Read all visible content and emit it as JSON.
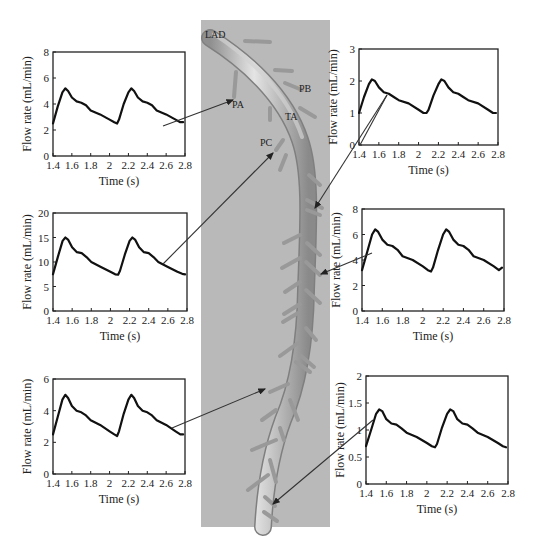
{
  "figure": {
    "vessel_image": {
      "background": "#b9b9b9",
      "labels": [
        {
          "id": "LAD",
          "text": "LAD",
          "x": 205,
          "y": 38
        },
        {
          "id": "PA",
          "text": "PA",
          "x": 232,
          "y": 108
        },
        {
          "id": "PB",
          "text": "PB",
          "x": 299,
          "y": 92
        },
        {
          "id": "TA",
          "text": "TA",
          "x": 285,
          "y": 120
        },
        {
          "id": "PC",
          "text": "PC",
          "x": 260,
          "y": 146
        }
      ]
    },
    "arrows": [
      {
        "from_chart": 0,
        "x1": 163,
        "y1": 126,
        "x2": 233,
        "y2": 100
      },
      {
        "from_chart": 1,
        "x1": 360,
        "y1": 145,
        "x2": 387,
        "y2": 95,
        "x3": 315,
        "y3": 208,
        "note": "line from right-top chart down to branch"
      },
      {
        "from_chart": 2,
        "x1": 163,
        "y1": 264,
        "x2": 273,
        "y2": 153
      },
      {
        "from_chart": 3,
        "x1": 372,
        "y1": 253,
        "x2": 321,
        "y2": 274
      },
      {
        "from_chart": 4,
        "x1": 172,
        "y1": 428,
        "x2": 265,
        "y2": 389
      },
      {
        "from_chart": 5,
        "x1": 373,
        "y1": 420,
        "x2": 273,
        "y2": 504
      }
    ]
  },
  "chart_data": [
    {
      "type": "line",
      "position": "top-left",
      "title": "",
      "xlabel": "Time (s)",
      "ylabel": "Flow rate (mL/min)",
      "xlim": [
        1.4,
        2.8
      ],
      "ylim": [
        0,
        8
      ],
      "xticks": [
        "1.4",
        "1.6",
        "1.8",
        "2",
        "2.2",
        "2.4",
        "2.6",
        "2.8"
      ],
      "yticks": [
        "0",
        "2",
        "4",
        "6",
        "8"
      ],
      "box": {
        "x": 53,
        "y": 52,
        "w": 132,
        "h": 104
      },
      "series": [
        {
          "name": "flow",
          "x": [
            1.4,
            1.45,
            1.5,
            1.53,
            1.56,
            1.6,
            1.65,
            1.7,
            1.75,
            1.8,
            1.9,
            2.0,
            2.05,
            2.08,
            2.1,
            2.15,
            2.2,
            2.23,
            2.26,
            2.3,
            2.35,
            2.4,
            2.45,
            2.5,
            2.6,
            2.7,
            2.75,
            2.78
          ],
          "values": [
            2.5,
            3.8,
            4.9,
            5.2,
            5.0,
            4.5,
            4.2,
            4.1,
            3.9,
            3.5,
            3.2,
            2.8,
            2.6,
            2.5,
            2.8,
            4.0,
            4.9,
            5.2,
            5.0,
            4.5,
            4.2,
            4.1,
            3.9,
            3.5,
            3.2,
            2.8,
            2.6,
            2.6
          ]
        }
      ]
    },
    {
      "type": "line",
      "position": "top-right",
      "title": "",
      "xlabel": "Time (s)",
      "ylabel": "Flow rate (mL/min)",
      "xlim": [
        1.4,
        2.8
      ],
      "ylim": [
        0,
        3
      ],
      "xticks": [
        "1.4",
        "1.6",
        "1.8",
        "2",
        "2.2",
        "2.4",
        "2.6",
        "2.8"
      ],
      "yticks": [
        "0",
        "1",
        "2",
        "3"
      ],
      "box": {
        "x": 359,
        "y": 49,
        "w": 139,
        "h": 96
      },
      "series": [
        {
          "name": "flow",
          "x": [
            1.4,
            1.45,
            1.5,
            1.53,
            1.56,
            1.6,
            1.65,
            1.7,
            1.75,
            1.8,
            1.9,
            2.0,
            2.05,
            2.08,
            2.1,
            2.15,
            2.2,
            2.23,
            2.26,
            2.3,
            2.35,
            2.4,
            2.45,
            2.5,
            2.6,
            2.7,
            2.75,
            2.78
          ],
          "values": [
            1.0,
            1.5,
            1.9,
            2.05,
            2.0,
            1.8,
            1.65,
            1.6,
            1.5,
            1.4,
            1.3,
            1.1,
            1.0,
            1.0,
            1.1,
            1.55,
            1.9,
            2.05,
            2.0,
            1.8,
            1.65,
            1.6,
            1.5,
            1.4,
            1.3,
            1.1,
            1.0,
            1.0
          ]
        }
      ]
    },
    {
      "type": "line",
      "position": "middle-left",
      "title": "",
      "xlabel": "Time (s)",
      "ylabel": "Flow rate (mL/min)",
      "xlim": [
        1.4,
        2.8
      ],
      "ylim": [
        0,
        20
      ],
      "xticks": [
        "1.4",
        "1.6",
        "1.8",
        "2",
        "2.2",
        "2.4",
        "2.6",
        "2.8"
      ],
      "yticks": [
        "0",
        "5",
        "10",
        "15",
        "20"
      ],
      "box": {
        "x": 53,
        "y": 213,
        "w": 134,
        "h": 98
      },
      "series": [
        {
          "name": "flow",
          "x": [
            1.4,
            1.45,
            1.5,
            1.53,
            1.56,
            1.6,
            1.65,
            1.7,
            1.75,
            1.8,
            1.9,
            2.0,
            2.05,
            2.08,
            2.1,
            2.15,
            2.2,
            2.23,
            2.26,
            2.3,
            2.35,
            2.4,
            2.45,
            2.5,
            2.6,
            2.7,
            2.75,
            2.78
          ],
          "values": [
            7.5,
            11.0,
            14.3,
            15.0,
            14.5,
            13.0,
            12.0,
            11.8,
            11.0,
            10.0,
            9.0,
            8.0,
            7.5,
            7.4,
            8.2,
            11.5,
            14.3,
            15.0,
            14.5,
            13.0,
            12.0,
            11.8,
            11.0,
            10.0,
            9.0,
            8.0,
            7.6,
            7.5
          ]
        }
      ]
    },
    {
      "type": "line",
      "position": "middle-right",
      "title": "",
      "xlabel": "Time (s)",
      "ylabel": "Flow rate (mL/min)",
      "xlim": [
        1.4,
        2.8
      ],
      "ylim": [
        0,
        8
      ],
      "xticks": [
        "1.4",
        "1.6",
        "1.8",
        "2",
        "2.2",
        "2.4",
        "2.6",
        "2.8"
      ],
      "yticks": [
        "0",
        "2",
        "4",
        "6",
        "8"
      ],
      "box": {
        "x": 362,
        "y": 209,
        "w": 142,
        "h": 102
      },
      "series": [
        {
          "name": "flow",
          "x": [
            1.4,
            1.45,
            1.5,
            1.53,
            1.56,
            1.6,
            1.65,
            1.7,
            1.75,
            1.8,
            1.9,
            2.0,
            2.05,
            2.08,
            2.1,
            2.15,
            2.2,
            2.23,
            2.26,
            2.3,
            2.35,
            2.4,
            2.45,
            2.5,
            2.6,
            2.7,
            2.75,
            2.78
          ],
          "values": [
            3.2,
            4.6,
            6.0,
            6.4,
            6.2,
            5.6,
            5.2,
            5.1,
            4.8,
            4.3,
            4.0,
            3.5,
            3.2,
            3.1,
            3.4,
            4.8,
            6.0,
            6.4,
            6.2,
            5.6,
            5.2,
            5.1,
            4.8,
            4.3,
            4.0,
            3.5,
            3.2,
            3.4
          ]
        }
      ]
    },
    {
      "type": "line",
      "position": "bottom-left",
      "title": "",
      "xlabel": "Time (s)",
      "ylabel": "Flow rate (mL/min)",
      "xlim": [
        1.4,
        2.8
      ],
      "ylim": [
        0,
        6
      ],
      "xticks": [
        "1.4",
        "1.6",
        "1.8",
        "2",
        "2.2",
        "2.4",
        "2.6",
        "2.8"
      ],
      "yticks": [
        "0",
        "2",
        "4",
        "6"
      ],
      "box": {
        "x": 53,
        "y": 379,
        "w": 132,
        "h": 95
      },
      "series": [
        {
          "name": "flow",
          "x": [
            1.4,
            1.45,
            1.5,
            1.53,
            1.56,
            1.6,
            1.65,
            1.7,
            1.75,
            1.8,
            1.9,
            2.0,
            2.05,
            2.08,
            2.1,
            2.15,
            2.2,
            2.23,
            2.26,
            2.3,
            2.35,
            2.4,
            2.45,
            2.5,
            2.6,
            2.7,
            2.75,
            2.78
          ],
          "values": [
            2.5,
            3.6,
            4.7,
            5.0,
            4.8,
            4.3,
            4.0,
            3.9,
            3.7,
            3.4,
            3.1,
            2.7,
            2.5,
            2.4,
            2.7,
            3.8,
            4.7,
            5.0,
            4.8,
            4.3,
            4.0,
            3.9,
            3.7,
            3.4,
            3.1,
            2.7,
            2.5,
            2.5
          ]
        }
      ]
    },
    {
      "type": "line",
      "position": "bottom-right",
      "title": "",
      "xlabel": "Time (s)",
      "ylabel": "Flow rate (mL/min)",
      "xlim": [
        1.4,
        2.8
      ],
      "ylim": [
        0,
        2
      ],
      "xticks": [
        "1.4",
        "1.6",
        "1.8",
        "2",
        "2.2",
        "2.4",
        "2.6",
        "2.8"
      ],
      "yticks": [
        "0",
        "0.5",
        "1",
        "1.5",
        "2"
      ],
      "box": {
        "x": 366,
        "y": 376,
        "w": 142,
        "h": 108
      },
      "series": [
        {
          "name": "flow",
          "x": [
            1.4,
            1.45,
            1.5,
            1.53,
            1.56,
            1.6,
            1.65,
            1.7,
            1.75,
            1.8,
            1.9,
            2.0,
            2.05,
            2.08,
            2.1,
            2.15,
            2.2,
            2.23,
            2.26,
            2.3,
            2.35,
            2.4,
            2.45,
            2.5,
            2.6,
            2.7,
            2.75,
            2.78
          ],
          "values": [
            0.7,
            1.0,
            1.3,
            1.38,
            1.35,
            1.2,
            1.12,
            1.1,
            1.03,
            0.95,
            0.87,
            0.76,
            0.7,
            0.68,
            0.74,
            1.05,
            1.3,
            1.38,
            1.35,
            1.2,
            1.12,
            1.1,
            1.03,
            0.95,
            0.87,
            0.76,
            0.7,
            0.68
          ]
        }
      ]
    }
  ]
}
